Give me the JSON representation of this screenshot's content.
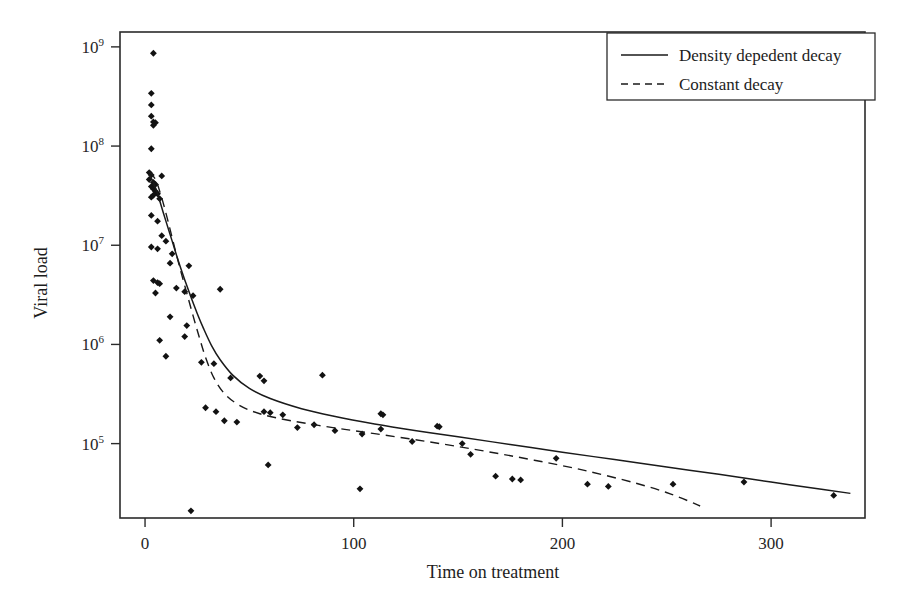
{
  "chart_data": {
    "type": "scatter",
    "title": "",
    "xlabel": "Time on treatment",
    "ylabel": "Viral load",
    "xlim": [
      -12,
      345
    ],
    "ylim": [
      4.25,
      9.15
    ],
    "yscale": "log",
    "grid": false,
    "legend_position": "top-right",
    "xticks": [
      0,
      100,
      200,
      300
    ],
    "xtick_labels": [
      "0",
      "100",
      "200",
      "300"
    ],
    "yticks": [
      100000,
      1000000,
      10000000,
      100000000,
      1000000000
    ],
    "ytick_labels": [
      "10^5",
      "10^6",
      "10^7",
      "10^8",
      "10^9"
    ],
    "ytick_mantissa": [
      "10",
      "10",
      "10",
      "10",
      "10"
    ],
    "ytick_exponents": [
      "5",
      "6",
      "7",
      "8",
      "9"
    ],
    "series": [
      {
        "name": "Observations",
        "type": "scatter",
        "marker": "filled-diamond",
        "color": "#121212",
        "points": [
          [
            4,
            862000000.0
          ],
          [
            3,
            340000000.0
          ],
          [
            3,
            260000000.0
          ],
          [
            3,
            200000000.0
          ],
          [
            4,
            175000000.0
          ],
          [
            5,
            172000000.0
          ],
          [
            4,
            162000000.0
          ],
          [
            3,
            94000000.0
          ],
          [
            2,
            54000000.0
          ],
          [
            3,
            51000000.0
          ],
          [
            8,
            50000000.0
          ],
          [
            2,
            46000000.0
          ],
          [
            4,
            43000000.0
          ],
          [
            5,
            41000000.0
          ],
          [
            3,
            39000000.0
          ],
          [
            4,
            37000000.0
          ],
          [
            5,
            35000000.0
          ],
          [
            6,
            33000000.0
          ],
          [
            4,
            32000000.0
          ],
          [
            3,
            30500000.0
          ],
          [
            7,
            29500000.0
          ],
          [
            3,
            20000000.0
          ],
          [
            6,
            17500000.0
          ],
          [
            8,
            12500000.0
          ],
          [
            10,
            11000000.0
          ],
          [
            3,
            9600000.0
          ],
          [
            6,
            9200000.0
          ],
          [
            13,
            8200000.0
          ],
          [
            12,
            6600000.0
          ],
          [
            21,
            6200000.0
          ],
          [
            4,
            4400000.0
          ],
          [
            6,
            4200000.0
          ],
          [
            7,
            4100000.0
          ],
          [
            5,
            3300000.0
          ],
          [
            15,
            3700000.0
          ],
          [
            19,
            3400000.0
          ],
          [
            23,
            3100000.0
          ],
          [
            36,
            3600000.0
          ],
          [
            12,
            1900000.0
          ],
          [
            20,
            1550000.0
          ],
          [
            7,
            1100000.0
          ],
          [
            19,
            1200000.0
          ],
          [
            10,
            760000.0
          ],
          [
            27,
            660000.0
          ],
          [
            33,
            640000.0
          ],
          [
            41,
            460000.0
          ],
          [
            55,
            480000.0
          ],
          [
            57,
            430000.0
          ],
          [
            85,
            490000.0
          ],
          [
            29,
            230000.0
          ],
          [
            34,
            210000.0
          ],
          [
            38,
            170000.0
          ],
          [
            44,
            165000.0
          ],
          [
            57,
            210000.0
          ],
          [
            60,
            205000.0
          ],
          [
            66,
            195000.0
          ],
          [
            73,
            145000.0
          ],
          [
            81,
            155000.0
          ],
          [
            91,
            135000.0
          ],
          [
            104,
            125000.0
          ],
          [
            113,
            200000.0
          ],
          [
            114,
            195000.0
          ],
          [
            113,
            140000.0
          ],
          [
            140,
            150000.0
          ],
          [
            141,
            148000.0
          ],
          [
            128,
            105000.0
          ],
          [
            152,
            100000.0
          ],
          [
            156,
            78000.0
          ],
          [
            168,
            47000.0
          ],
          [
            176,
            44000.0
          ],
          [
            180,
            43000.0
          ],
          [
            197,
            71000.0
          ],
          [
            212,
            39000.0
          ],
          [
            222,
            37000.0
          ],
          [
            253,
            39000.0
          ],
          [
            287,
            41000.0
          ],
          [
            330,
            30000.0
          ],
          [
            103,
            35000.0
          ],
          [
            59,
            61000.0
          ],
          [
            22,
            21000.0
          ]
        ]
      },
      {
        "name": "Density depedent decay",
        "type": "line",
        "style": "solid",
        "color": "#1a1a1a",
        "points": [
          [
            2,
            52000000.0
          ],
          [
            4,
            43000000.0
          ],
          [
            6,
            33000000.0
          ],
          [
            8,
            24000000.0
          ],
          [
            10,
            17500000.0
          ],
          [
            13,
            11000000.0
          ],
          [
            16,
            6900000.0
          ],
          [
            19,
            4500000.0
          ],
          [
            22,
            3000000.0
          ],
          [
            25,
            2050000.0
          ],
          [
            28,
            1450000.0
          ],
          [
            32,
            960000.0
          ],
          [
            36,
            700000.0
          ],
          [
            42,
            490000.0
          ],
          [
            50,
            360000.0
          ],
          [
            60,
            285000.0
          ],
          [
            75,
            225000.0
          ],
          [
            90,
            190000.0
          ],
          [
            110,
            158000.0
          ],
          [
            130,
            135000.0
          ],
          [
            150,
            117000.0
          ],
          [
            175,
            98000.0
          ],
          [
            200,
            82000.0
          ],
          [
            225,
            69000.0
          ],
          [
            250,
            58000.0
          ],
          [
            275,
            49000.0
          ],
          [
            300,
            41000.0
          ],
          [
            325,
            34500.0
          ],
          [
            338,
            31500.0
          ]
        ]
      },
      {
        "name": "Constant decay",
        "type": "line",
        "style": "dashed",
        "color": "#1a1a1a",
        "points": [
          [
            2,
            55000000.0
          ],
          [
            5,
            46000000.0
          ],
          [
            8,
            30000000.0
          ],
          [
            11,
            17500000.0
          ],
          [
            14,
            9800000.0
          ],
          [
            17,
            5600000.0
          ],
          [
            20,
            3300000.0
          ],
          [
            23,
            1950000.0
          ],
          [
            26,
            1180000.0
          ],
          [
            29,
            740000.0
          ],
          [
            33,
            460000.0
          ],
          [
            38,
            320000.0
          ],
          [
            45,
            245000.0
          ],
          [
            55,
            200000.0
          ],
          [
            70,
            170000.0
          ],
          [
            90,
            145000.0
          ],
          [
            110,
            126000.0
          ],
          [
            135,
            105000.0
          ],
          [
            160,
            86000.0
          ],
          [
            185,
            69000.0
          ],
          [
            210,
            54000.0
          ],
          [
            235,
            40000.0
          ],
          [
            252,
            31000.0
          ],
          [
            266,
            23500.0
          ]
        ]
      }
    ]
  },
  "axes": {
    "x_title": "Time on treatment",
    "y_title": "Viral load",
    "x_tick_labels": [
      "0",
      "100",
      "200",
      "300"
    ],
    "y_tick_base": "10",
    "y_tick_exponents": [
      "9",
      "8",
      "7",
      "6",
      "5"
    ]
  },
  "legend": {
    "entries": [
      {
        "label": "Density depedent decay",
        "style": "solid"
      },
      {
        "label": "Constant decay",
        "style": "dashed"
      }
    ]
  },
  "colors": {
    "ink": "#1a1a1a",
    "axis": "#2b2b2b",
    "marker": "#121212",
    "background": "#ffffff"
  }
}
